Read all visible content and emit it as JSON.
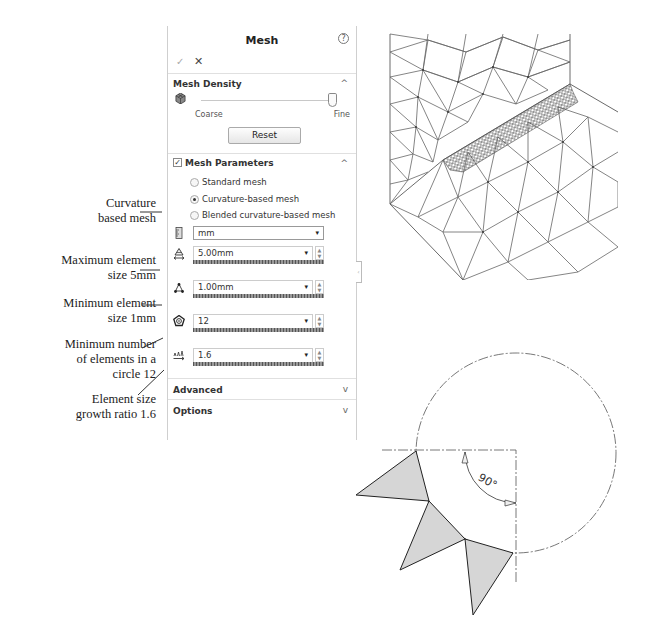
{
  "annotations": [
    {
      "id": "curvature",
      "text": "Curvature\nbased mesh"
    },
    {
      "id": "max-size",
      "text": "Maximum element\nsize 5mm"
    },
    {
      "id": "min-size",
      "text": "Minimum element\nsize 1mm"
    },
    {
      "id": "min-circle",
      "text": "Minimum number\nof elements in a\ncircle 12"
    },
    {
      "id": "growth",
      "text": "Element size\ngrowth ratio 1.6"
    }
  ],
  "panel": {
    "title": "Mesh",
    "help_icon": "?",
    "ok_icon": "✓",
    "cancel_icon": "✕",
    "mesh_density": {
      "title": "Mesh Density",
      "collapse_icon": "^",
      "coarse_label": "Coarse",
      "fine_label": "Fine",
      "slider_position": "fine",
      "reset_label": "Reset"
    },
    "mesh_parameters": {
      "title": "Mesh Parameters",
      "checked": true,
      "check_glyph": "✓",
      "collapse_icon": "^",
      "options": [
        {
          "label": "Standard mesh",
          "selected": false
        },
        {
          "label": "Curvature-based mesh",
          "selected": true
        },
        {
          "label": "Blended curvature-based mesh",
          "selected": false
        }
      ],
      "unit": "mm",
      "dropdown_glyph": "▾",
      "fields": [
        {
          "name": "max-element-size",
          "value": "5.00mm"
        },
        {
          "name": "min-element-size",
          "value": "1.00mm"
        },
        {
          "name": "min-elements-in-circle",
          "value": "12"
        },
        {
          "name": "element-size-growth-ratio",
          "value": "1.6"
        }
      ]
    },
    "advanced": {
      "title": "Advanced",
      "expand_icon": "v"
    },
    "options": {
      "title": "Options",
      "expand_icon": "v"
    },
    "side_handle": "‹"
  },
  "diagram": {
    "angle_label": "90°"
  },
  "colors": {
    "panel_border": "#cfcfcf",
    "mesh_line": "#555555",
    "triangle_fill": "#d6d6d6"
  }
}
